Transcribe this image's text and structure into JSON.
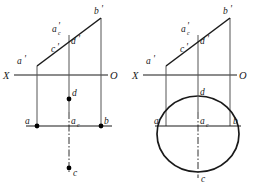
{
  "figure": {
    "background_color": "#ffffff",
    "line_color": "#1a1a1a",
    "point_color": "#000000",
    "axis_labels": {
      "x": "X",
      "o": "O"
    },
    "diagrams": [
      {
        "id": "left-diagram",
        "name": "left-projection-diagram",
        "labels": {
          "a_prime_low": "a",
          "a_prime_low_mark": "'",
          "a_c_prime": "a",
          "a_c_prime_sub": "c",
          "a_c_prime_mark": "'",
          "b_prime": "b",
          "b_prime_mark": "'",
          "c_prime": "c",
          "c_prime_mark": "'",
          "d_prime": "d",
          "d_prime_mark": "'",
          "axis_x": "X",
          "axis_o": "O",
          "d": "d",
          "a": "a",
          "a_c": "a",
          "a_c_sub": "c",
          "b": "b",
          "c": "c"
        },
        "points": [
          {
            "name": "a",
            "x": 37,
            "y": 126
          },
          {
            "name": "a_c",
            "x": 69,
            "y": 126
          },
          {
            "name": "b",
            "x": 101,
            "y": 126
          },
          {
            "name": "d",
            "x": 69,
            "y": 99
          },
          {
            "name": "c",
            "x": 69,
            "y": 168
          }
        ],
        "has_circle": false
      },
      {
        "id": "right-diagram",
        "name": "right-projection-diagram",
        "labels": {
          "a_prime_low": "a",
          "a_prime_low_mark": "'",
          "a_c_prime": "a",
          "a_c_prime_sub": "c",
          "a_c_prime_mark": "'",
          "b_prime": "b",
          "b_prime_mark": "'",
          "c_prime": "c",
          "c_prime_mark": "'",
          "d_prime": "d",
          "d_prime_mark": "'",
          "axis_x": "X",
          "axis_o": "O",
          "d": "d",
          "a": "a",
          "a_c": "a",
          "a_c_sub": "c",
          "b": "b",
          "c": "c"
        },
        "circle": {
          "center_x": 198,
          "center_y": 134,
          "radius_x": 41,
          "radius_y": 38
        },
        "has_circle": true
      }
    ]
  }
}
